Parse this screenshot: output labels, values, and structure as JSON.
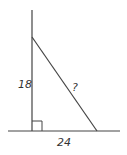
{
  "diagram": {
    "type": "right-triangle",
    "labels": {
      "vertical_side": "18",
      "horizontal_side": "24",
      "hypotenuse": "?"
    },
    "colors": {
      "line": "#444444",
      "text": "#333333",
      "background": "#ffffff"
    }
  }
}
